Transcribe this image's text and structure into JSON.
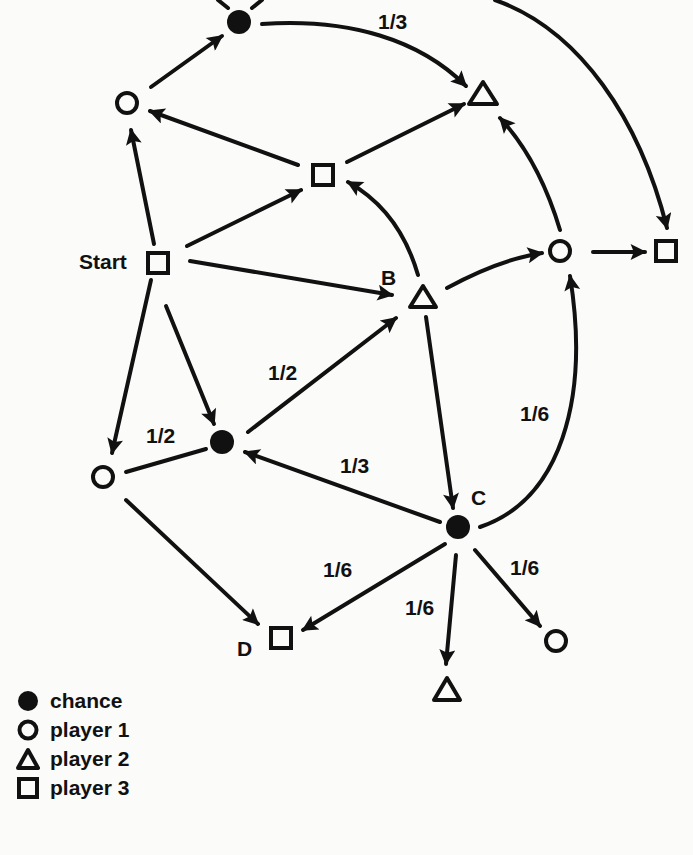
{
  "diagram": {
    "type": "state-graph",
    "nodes": [
      {
        "id": "top-chance",
        "kind": "chance",
        "label": ""
      },
      {
        "id": "p1-upper-left",
        "kind": "player1",
        "label": ""
      },
      {
        "id": "p2-top",
        "kind": "player2",
        "label": ""
      },
      {
        "id": "p3-middle",
        "kind": "player3",
        "label": ""
      },
      {
        "id": "start",
        "kind": "player3",
        "label": "Start"
      },
      {
        "id": "B",
        "kind": "player2",
        "label": "B"
      },
      {
        "id": "p1-right",
        "kind": "player1",
        "label": ""
      },
      {
        "id": "p3-right",
        "kind": "player3",
        "label": ""
      },
      {
        "id": "chance-mid",
        "kind": "chance",
        "label": ""
      },
      {
        "id": "p1-lower-left",
        "kind": "player1",
        "label": ""
      },
      {
        "id": "C",
        "kind": "chance",
        "label": "C"
      },
      {
        "id": "D",
        "kind": "player3",
        "label": "D"
      },
      {
        "id": "p2-bottom",
        "kind": "player2",
        "label": ""
      },
      {
        "id": "p1-bottom-right",
        "kind": "player1",
        "label": ""
      }
    ],
    "edges": [
      {
        "from": "p1-upper-left",
        "to": "top-chance",
        "prob": ""
      },
      {
        "from": "top-chance",
        "to": "p2-top",
        "prob": "1/3"
      },
      {
        "from": "top-chance",
        "to": "p3-right",
        "prob": ""
      },
      {
        "from": "start",
        "to": "p1-upper-left",
        "prob": ""
      },
      {
        "from": "start",
        "to": "p3-middle",
        "prob": ""
      },
      {
        "from": "p3-middle",
        "to": "p1-upper-left",
        "prob": ""
      },
      {
        "from": "p3-middle",
        "to": "p2-top",
        "prob": ""
      },
      {
        "from": "start",
        "to": "B",
        "prob": ""
      },
      {
        "from": "B",
        "to": "p3-middle",
        "prob": ""
      },
      {
        "from": "B",
        "to": "p1-right",
        "prob": ""
      },
      {
        "from": "p1-right",
        "to": "p2-top",
        "prob": ""
      },
      {
        "from": "p1-right",
        "to": "p3-right",
        "prob": ""
      },
      {
        "from": "start",
        "to": "p1-lower-left",
        "prob": ""
      },
      {
        "from": "start",
        "to": "chance-mid",
        "prob": ""
      },
      {
        "from": "chance-mid",
        "to": "B",
        "prob": "1/2"
      },
      {
        "from": "chance-mid",
        "to": "p1-lower-left",
        "prob": "1/2"
      },
      {
        "from": "B",
        "to": "C",
        "prob": ""
      },
      {
        "from": "C",
        "to": "chance-mid",
        "prob": "1/3"
      },
      {
        "from": "C",
        "to": "p1-right",
        "prob": "1/6"
      },
      {
        "from": "C",
        "to": "D",
        "prob": "1/6"
      },
      {
        "from": "C",
        "to": "p2-bottom",
        "prob": "1/6"
      },
      {
        "from": "C",
        "to": "p1-bottom-right",
        "prob": "1/6"
      },
      {
        "from": "p1-lower-left",
        "to": "D",
        "prob": ""
      }
    ],
    "labels": {
      "start": "Start",
      "b": "B",
      "c": "C",
      "d": "D",
      "prob_top": "1/3",
      "prob_mid_b": "1/2",
      "prob_mid_left": "1/2",
      "prob_c_mid": "1/3",
      "prob_c_right": "1/6",
      "prob_c_d": "1/6",
      "prob_c_bottom": "1/6",
      "prob_c_bottom_right": "1/6"
    }
  },
  "legend": [
    {
      "symbol": "filled-circle",
      "label": "chance"
    },
    {
      "symbol": "open-circle",
      "label": "player 1"
    },
    {
      "symbol": "open-triangle",
      "label": "player 2"
    },
    {
      "symbol": "open-square",
      "label": "player 3"
    }
  ],
  "colors": {
    "ink": "#111111",
    "paper": "#fbfbf9",
    "bleed": "#e4e4e0"
  }
}
